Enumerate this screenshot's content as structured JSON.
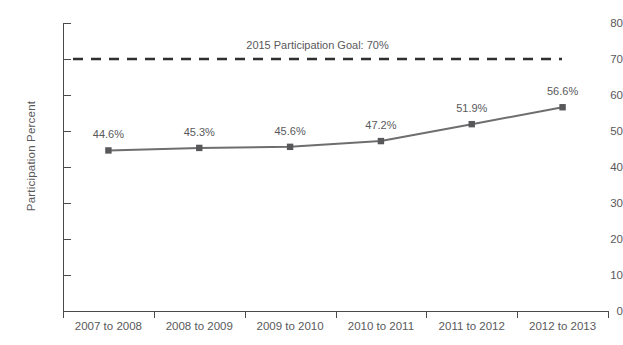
{
  "chart_data": {
    "type": "line",
    "title": "",
    "xlabel": "",
    "ylabel": "Participation Percent",
    "categories": [
      "2007 to 2008",
      "2008 to 2009",
      "2009 to 2010",
      "2010 to 2011",
      "2011 to 2012",
      "2012 to 2013"
    ],
    "values": [
      44.6,
      45.3,
      45.6,
      47.2,
      51.9,
      56.6
    ],
    "point_labels": [
      "44.6%",
      "45.3%",
      "45.6%",
      "47.2%",
      "51.9%",
      "56.6%"
    ],
    "ylim": [
      0,
      80
    ],
    "ytick_values": [
      0,
      10,
      20,
      30,
      40,
      50,
      60,
      70,
      80
    ],
    "ytick_labels": [
      "0",
      "10",
      "20",
      "30",
      "40",
      "50",
      "60",
      "70",
      "80"
    ],
    "grid": false,
    "legend": "none",
    "annotations": [
      {
        "name": "goal-line",
        "text": "2015 Participation Goal: 70%",
        "value": 70,
        "style": "dashed"
      }
    ],
    "colors": {
      "line": "#6e6e70",
      "marker": "#58585a",
      "axis": "#4a4a4a",
      "text": "#59595b",
      "goal_line": "#2f2f2f",
      "background": "#ffffff"
    }
  },
  "cropped_title": ""
}
